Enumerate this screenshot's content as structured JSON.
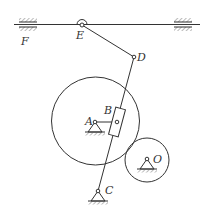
{
  "diagram": {
    "type": "mechanism-linkage",
    "labels": {
      "F": "F",
      "E": "E",
      "D": "D",
      "A": "A",
      "B": "B",
      "C": "C",
      "O": "O"
    },
    "points": {
      "E": [
        82,
        25
      ],
      "D": [
        134,
        57
      ],
      "A": [
        95,
        122
      ],
      "B": [
        117,
        122
      ],
      "C": [
        98,
        191
      ],
      "O": [
        147,
        159
      ]
    },
    "circles": {
      "large": {
        "center": [
          95.5,
          121
        ],
        "radius": 44
      },
      "small": {
        "center": [
          147,
          160
        ],
        "radius": 22
      }
    },
    "colors": {
      "line": "#333333",
      "background": "#ffffff"
    }
  }
}
